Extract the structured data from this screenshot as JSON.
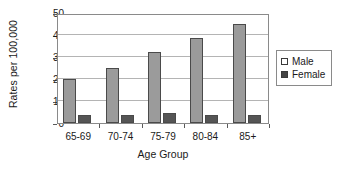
{
  "chart_data": {
    "type": "bar",
    "title": "",
    "xlabel": "Age Group",
    "ylabel": "Rates per 100,000",
    "categories": [
      "65-69",
      "70-74",
      "75-79",
      "80-84",
      "85+"
    ],
    "series": [
      {
        "name": "Male",
        "values": [
          20,
          25,
          32.5,
          38.5,
          45
        ],
        "color": "#9b9b9b"
      },
      {
        "name": "Female",
        "values": [
          3.5,
          3.5,
          4.5,
          3.5,
          3.5
        ],
        "color": "#555555"
      }
    ],
    "ylim": [
      0,
      50
    ],
    "yticks": [
      0,
      10,
      20,
      30,
      40,
      50
    ],
    "ytick_labels": [
      "0",
      "10",
      "20",
      "30",
      "40",
      "50"
    ],
    "grid": true,
    "grid_axis": "y",
    "legend_position": "right",
    "legend_entries": [
      {
        "label": "Male",
        "swatch": "#ffffff"
      },
      {
        "label": "Female",
        "swatch": "#444444"
      }
    ]
  }
}
